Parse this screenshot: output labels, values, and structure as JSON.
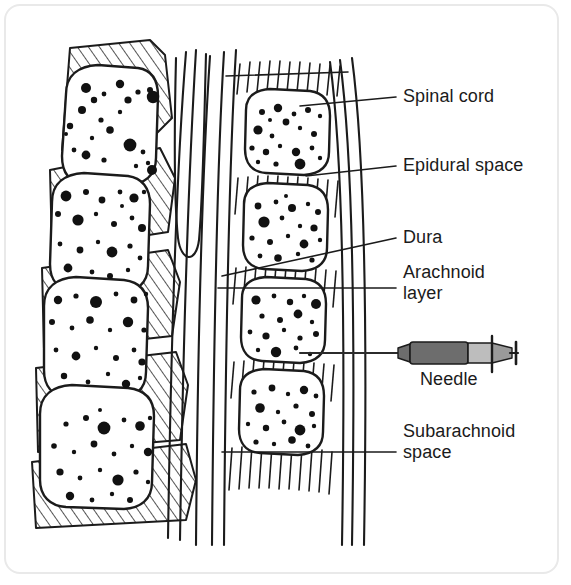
{
  "figure": {
    "background_color": "#ffffff",
    "frame_color": "#e9e9e9",
    "ink_color": "#1b1b1b"
  },
  "labels": [
    {
      "id": "spinal-cord",
      "text": "Spinal cord",
      "x": 403,
      "y": 86,
      "lines": [
        "Spinal cord"
      ]
    },
    {
      "id": "epidural-space",
      "text": "Epidural space",
      "x": 403,
      "y": 155,
      "lines": [
        "Epidural space"
      ]
    },
    {
      "id": "dura",
      "text": "Dura",
      "x": 403,
      "y": 227,
      "lines": [
        "Dura"
      ]
    },
    {
      "id": "arachnoid-layer",
      "text": "Arachnoid layer",
      "x": 403,
      "y": 262,
      "lines": [
        "Arachnoid",
        "layer"
      ]
    },
    {
      "id": "needle",
      "text": "Needle",
      "x": 420,
      "y": 369,
      "lines": [
        "Needle"
      ]
    },
    {
      "id": "subarachnoid-space",
      "text": "Subarachnoid space",
      "x": 403,
      "y": 421,
      "lines": [
        "Subarachnoid",
        "space"
      ]
    }
  ],
  "leader_lines": [
    {
      "id": "leader-spinal-cord",
      "points": "396,97 300,106",
      "label": "Spinal cord"
    },
    {
      "id": "leader-epidural-space",
      "points": "396,166 306,176",
      "label": "Epidural space"
    },
    {
      "id": "leader-dura",
      "points": "396,238 222,276",
      "label": "Dura"
    },
    {
      "id": "leader-arachnoid-layer",
      "points": "396,288 218,288",
      "label": "Arachnoid layer"
    },
    {
      "id": "leader-subarachnoid-space",
      "points": "396,452 222,452",
      "label": "Subarachnoid space"
    }
  ],
  "needle": {
    "label": "Needle",
    "shaft_color": "#2b2b2b",
    "barrel_color": "#6d6d6d",
    "plunger_color": "#bdbdbd",
    "tip_color": "#8f8f8f",
    "outline_color": "#1b1b1b",
    "shaft_start_x": 300,
    "shaft_end_x": 400,
    "barrel_x": 408,
    "barrel_width": 60,
    "plunger_x": 468,
    "plunger_width": 24,
    "y_center": 353
  },
  "anatomy": {
    "left_column_name": "vertebral bodies with intervertebral discs",
    "right_column_name": "vertebral bodies with interspinous ligaments",
    "center_gap_name": "spinous process and ligamentum flavum",
    "vertebra_count_left": 4,
    "vertebra_count_right": 4,
    "disc_hatch_style": "diagonal",
    "ligament_hatch_style": "vertical"
  }
}
